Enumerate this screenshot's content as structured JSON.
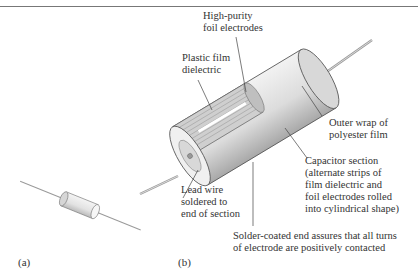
{
  "figure": {
    "panels": [
      {
        "id": "a",
        "label": "(a)"
      },
      {
        "id": "b",
        "label": "(b)"
      }
    ],
    "callouts": {
      "high_purity": [
        "High-purity",
        "foil electrodes"
      ],
      "plastic_film": [
        "Plastic film",
        "dielectric"
      ],
      "outer_wrap": [
        "Outer wrap of",
        "polyester film"
      ],
      "capacitor_section": [
        "Capacitor section",
        "(alternate strips of",
        "film dielectric and",
        "foil electrodes rolled",
        "into cylindrical shape)"
      ],
      "lead_wire": [
        "Lead wire",
        "soldered to",
        "end of section"
      ],
      "solder_end": [
        "Solder-coated end assures that all turns",
        "of electrode are positively contacted"
      ]
    },
    "colors": {
      "text": "#333333",
      "leader": "#444444",
      "body_fill": "#e6e6e6",
      "body_shade": "#bdbdbd",
      "wire": "#9a9a9a"
    }
  }
}
